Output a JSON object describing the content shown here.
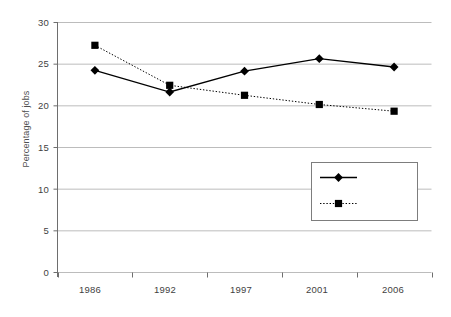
{
  "chart_data": {
    "type": "line",
    "title": "",
    "xlabel": "",
    "ylabel": "Percentage of jobs",
    "categories": [
      "1986",
      "1992",
      "1997",
      "2001",
      "2006"
    ],
    "series": [
      {
        "name": "> 2 years",
        "marker": "diamond",
        "linestyle": "solid",
        "color": "#000000",
        "values": [
          24.2,
          21.6,
          24.1,
          25.6,
          24.6
        ]
      },
      {
        "name": "< 1 month",
        "marker": "square",
        "linestyle": "dotted",
        "color": "#000000",
        "values": [
          27.2,
          22.4,
          21.2,
          20.1,
          19.3
        ]
      }
    ],
    "ylim": [
      0,
      30
    ],
    "yticks": [
      0,
      5,
      10,
      15,
      20,
      25,
      30
    ],
    "ytick_labels": [
      "0",
      "5",
      "10",
      "15",
      "20",
      "25",
      "30"
    ],
    "grid": true,
    "grid_axis": "y",
    "legend_position": "lower right",
    "gridline_color": "#bcbcbc",
    "axis_color": "#6e6e6e"
  },
  "legend": {
    "entries": [
      {
        "label": "> 2 years"
      },
      {
        "label": "< 1 month"
      }
    ]
  }
}
